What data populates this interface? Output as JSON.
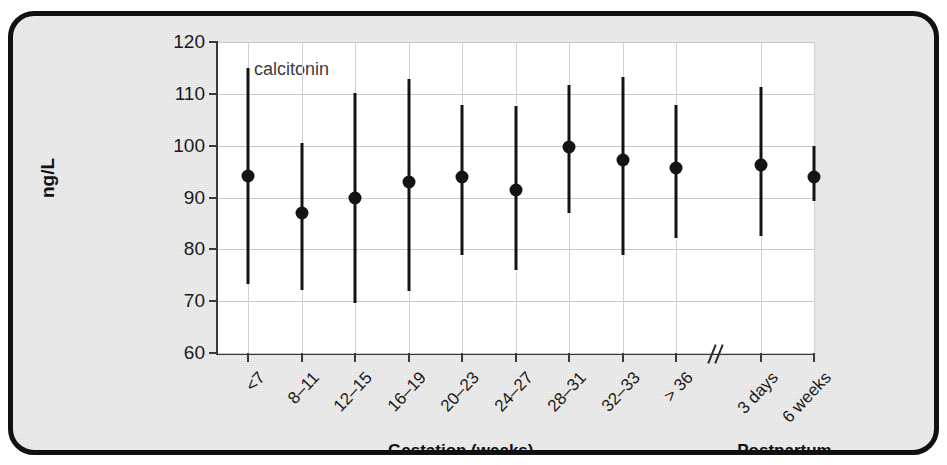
{
  "figure": {
    "series_label": "calcitonin",
    "y_axis_title": "ng/L",
    "group_labels": {
      "gestation": "Gestation (weeks)",
      "postpartum": "Postpartum"
    },
    "bleed_text": {
      "left": "",
      "right": ""
    }
  },
  "chart_data": {
    "type": "scatter",
    "title": "calcitonin",
    "xlabel": "Gestation (weeks)",
    "xlabel2": "Postpartum",
    "ylabel": "ng/L",
    "ylim": [
      60,
      120
    ],
    "yticks": [
      60,
      70,
      80,
      90,
      100,
      110,
      120
    ],
    "ytick_labels": [
      "60",
      "70",
      "80",
      "90",
      "100",
      "110",
      "120"
    ],
    "grid": true,
    "legend_position": "none",
    "axis_break_after_category_index": 8,
    "annotations": [
      "calcitonin"
    ],
    "categories": [
      "<7",
      "8–11",
      "12–15",
      "16–19",
      "20–23",
      "24–27",
      "28–31",
      "32–33",
      "> 36",
      "3 days",
      "6 weeks"
    ],
    "category_groups": [
      "Gestation (weeks)",
      "Gestation (weeks)",
      "Gestation (weeks)",
      "Gestation (weeks)",
      "Gestation (weeks)",
      "Gestation (weeks)",
      "Gestation (weeks)",
      "Gestation (weeks)",
      "Gestation (weeks)",
      "Postpartum",
      "Postpartum"
    ],
    "series": [
      {
        "name": "calcitonin",
        "values": [
          94.1,
          87.0,
          90.0,
          92.9,
          94.0,
          91.5,
          99.7,
          97.3,
          95.6,
          96.3,
          94.0
        ],
        "range_low": [
          73.4,
          72.1,
          69.6,
          72.0,
          78.9,
          76.0,
          87.0,
          79.0,
          82.1,
          82.5,
          89.4
        ],
        "range_high": [
          115.0,
          100.5,
          110.2,
          112.8,
          107.9,
          107.6,
          111.8,
          113.3,
          107.9,
          111.4,
          100.0
        ]
      }
    ]
  }
}
